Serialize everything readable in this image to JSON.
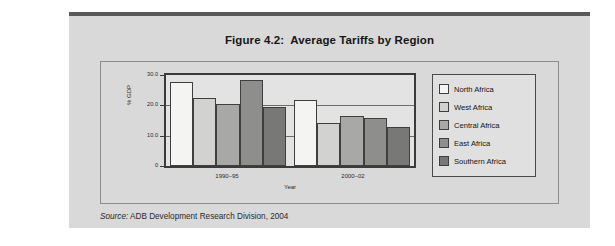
{
  "figure": {
    "title": "Figure 4.2:  Average Tariffs by Region",
    "source_prefix": "Source:",
    "source_text": " ADB Development Research Division, 2004"
  },
  "chart_data": {
    "type": "bar",
    "title": "Figure 4.2:  Average Tariffs by Region",
    "xlabel": "Year",
    "ylabel": "% GDP",
    "categories": [
      "1990–95",
      "2000–02"
    ],
    "ylim": [
      0,
      30
    ],
    "yticks": [
      "0",
      "10.0",
      "20.0",
      "30.0"
    ],
    "ytick_values": [
      0,
      10,
      20,
      30
    ],
    "grid": true,
    "legend_position": "right",
    "series": [
      {
        "name": "North Africa",
        "color": "#f4f4f2",
        "values": [
          27.8,
          21.8
        ]
      },
      {
        "name": "West Africa",
        "color": "#d2d2d0",
        "values": [
          22.5,
          14.2
        ]
      },
      {
        "name": "Central Africa",
        "color": "#a8a8a6",
        "values": [
          20.6,
          16.5
        ]
      },
      {
        "name": "East Africa",
        "color": "#8e8e8c",
        "values": [
          28.5,
          15.7
        ]
      },
      {
        "name": "Southern Africa",
        "color": "#787876",
        "values": [
          19.5,
          12.8
        ]
      }
    ]
  }
}
